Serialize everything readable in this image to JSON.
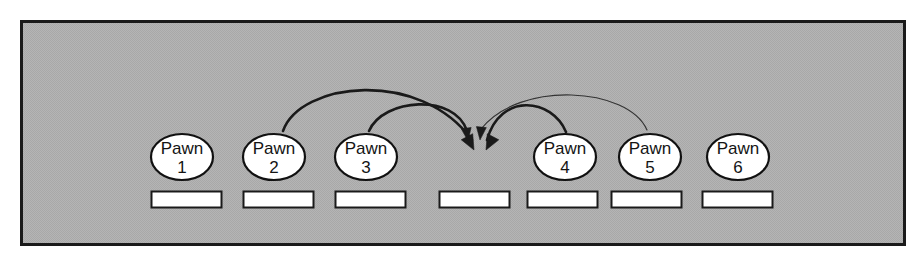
{
  "figure": {
    "name": "pawn-row-diagram",
    "background_color": "#ffffff",
    "panel": {
      "fill_color": "#b3b3b3",
      "border_color": "#1a1a1a",
      "x": 21,
      "y": 21,
      "width": 884,
      "height": 224
    }
  },
  "nodes": [
    {
      "id": "pawn-1",
      "label": "Pawn",
      "number": "1",
      "cx": 182,
      "cy": 157,
      "rx": 31,
      "ry": 23,
      "fill": "#ffffff",
      "stroke": "#111111"
    },
    {
      "id": "pawn-2",
      "label": "Pawn",
      "number": "2",
      "cx": 274,
      "cy": 157,
      "rx": 31,
      "ry": 23,
      "fill": "#ffffff",
      "stroke": "#111111"
    },
    {
      "id": "pawn-3",
      "label": "Pawn",
      "number": "3",
      "cx": 366,
      "cy": 157,
      "rx": 31,
      "ry": 23,
      "fill": "#ffffff",
      "stroke": "#111111"
    },
    {
      "id": "pawn-4",
      "label": "Pawn",
      "number": "4",
      "cx": 565,
      "cy": 157,
      "rx": 31,
      "ry": 23,
      "fill": "#ffffff",
      "stroke": "#111111"
    },
    {
      "id": "pawn-5",
      "label": "Pawn",
      "number": "5",
      "cx": 650,
      "cy": 157,
      "rx": 31,
      "ry": 23,
      "fill": "#ffffff",
      "stroke": "#111111"
    },
    {
      "id": "pawn-6",
      "label": "Pawn",
      "number": "6",
      "cx": 738,
      "cy": 157,
      "rx": 31,
      "ry": 23,
      "fill": "#ffffff",
      "stroke": "#111111"
    }
  ],
  "slots": [
    {
      "id": "slot-1",
      "x": 151,
      "y": 191,
      "width": 71,
      "height": 17,
      "fill": "#ffffff",
      "stroke": "#1a1a1a"
    },
    {
      "id": "slot-2",
      "x": 243,
      "y": 191,
      "width": 71,
      "height": 17,
      "fill": "#ffffff",
      "stroke": "#1a1a1a"
    },
    {
      "id": "slot-3",
      "x": 335,
      "y": 191,
      "width": 71,
      "height": 17,
      "fill": "#ffffff",
      "stroke": "#1a1a1a"
    },
    {
      "id": "slot-4",
      "x": 439,
      "y": 191,
      "width": 71,
      "height": 17,
      "fill": "#ffffff",
      "stroke": "#1a1a1a"
    },
    {
      "id": "slot-5",
      "x": 527,
      "y": 191,
      "width": 71,
      "height": 17,
      "fill": "#ffffff",
      "stroke": "#1a1a1a"
    },
    {
      "id": "slot-6",
      "x": 611,
      "y": 191,
      "width": 71,
      "height": 17,
      "fill": "#ffffff",
      "stroke": "#1a1a1a"
    },
    {
      "id": "slot-7",
      "x": 702,
      "y": 191,
      "width": 71,
      "height": 17,
      "fill": "#ffffff",
      "stroke": "#1a1a1a"
    }
  ],
  "arrows": [
    {
      "id": "arrow-from-pawn-2",
      "from": "pawn-2",
      "to": "target-slot",
      "path": "M 283 131 C 300 82, 420 68, 472 140",
      "stroke": "#1a1a1a",
      "stroke_width": 2.6,
      "arrowhead": "filled-triangle",
      "head_x": 474,
      "head_y": 148,
      "head_angle": 58
    },
    {
      "id": "arrow-from-pawn-3",
      "from": "pawn-3",
      "to": "target-slot",
      "path": "M 369 131 C 383 98, 455 93, 467 131",
      "stroke": "#1a1a1a",
      "stroke_width": 2.6,
      "arrowhead": "filled-triangle",
      "head_x": 468,
      "head_y": 137,
      "head_angle": 80
    },
    {
      "id": "arrow-from-pawn-4",
      "from": "pawn-4",
      "to": "target-slot",
      "path": "M 566 132 C 552 98, 500 92, 487 140",
      "stroke": "#1a1a1a",
      "stroke_width": 2.6,
      "arrowhead": "filled-triangle",
      "head_x": 485,
      "head_y": 148,
      "head_angle": 122
    },
    {
      "id": "arrow-from-pawn-5",
      "from": "pawn-5",
      "to": "target-slot",
      "path": "M 647 130 C 628 87, 520 80, 481 129",
      "stroke": "#333333",
      "stroke_width": 1.2,
      "arrowhead": "filled-triangle",
      "head_x": 480,
      "head_y": 136,
      "head_angle": 100
    }
  ],
  "target": {
    "id": "target-slot",
    "label": "empty-slot-4",
    "x": 439,
    "y": 191
  }
}
